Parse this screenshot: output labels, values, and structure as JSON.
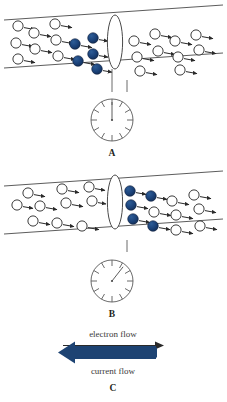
{
  "figure": {
    "background_color": "#ffffff",
    "colors": {
      "carrier_filled": "#17396b",
      "carrier_open_fill": "#ffffff",
      "outline": "#3b3b3b",
      "tube": "#4a4a4a",
      "current_arrow": "#1d4373",
      "text": "#231f20"
    }
  },
  "panels": [
    {
      "id": "A",
      "label": "A",
      "tube": {
        "name": "conductor-tube",
        "top_left_y": 14,
        "top_right_y": 6,
        "bottom_left_y": 62,
        "bottom_right_y": 54
      },
      "barrier": {
        "name": "cross-section-lens",
        "cx": 114,
        "cy": 40,
        "rx": 7.5,
        "ry": 27
      },
      "gauge": {
        "name": "ammeter-A",
        "cx": 112,
        "cy": 122,
        "r": 21,
        "needle_angle_deg": 0,
        "needle_reading": "zero",
        "tick_count": 12
      },
      "carriers_filled_count": 5,
      "carriers_open_count": 21,
      "filled_side": "left"
    },
    {
      "id": "B",
      "label": "B",
      "tube": {
        "name": "conductor-tube",
        "top_left_y": 178,
        "top_right_y": 170,
        "bottom_left_y": 226,
        "bottom_right_y": 218
      },
      "barrier": {
        "name": "cross-section-lens",
        "cx": 114,
        "cy": 200,
        "rx": 7.5,
        "ry": 27
      },
      "gauge": {
        "name": "ammeter-B",
        "cx": 112,
        "cy": 282,
        "r": 21,
        "needle_angle_deg": 38,
        "needle_reading": "deflected",
        "tick_count": 12
      },
      "carriers_filled_count": 5,
      "carriers_open_count": 21,
      "filled_side": "right"
    },
    {
      "id": "C",
      "label": "C",
      "electron_flow_label": "electron flow",
      "electron_flow_direction": "right",
      "current_flow_label": "current flow",
      "current_flow_direction": "left"
    }
  ],
  "labels": {
    "panel_a": "A",
    "panel_b": "B",
    "panel_c": "C",
    "electron_flow": "electron flow",
    "current_flow": "current flow"
  },
  "carriers_panel_a": {
    "open": [
      {
        "x": 18,
        "y": 25
      },
      {
        "x": 34,
        "y": 31
      },
      {
        "x": 52,
        "y": 23
      },
      {
        "x": 70,
        "y": 29
      },
      {
        "x": 16,
        "y": 41
      },
      {
        "x": 34,
        "y": 46
      },
      {
        "x": 52,
        "y": 39
      },
      {
        "x": 18,
        "y": 55
      },
      {
        "x": 36,
        "y": 60
      },
      {
        "x": 54,
        "y": 54
      },
      {
        "x": 132,
        "y": 30
      },
      {
        "x": 150,
        "y": 24
      },
      {
        "x": 168,
        "y": 31
      },
      {
        "x": 188,
        "y": 25
      },
      {
        "x": 206,
        "y": 31
      },
      {
        "x": 134,
        "y": 46
      },
      {
        "x": 152,
        "y": 41
      },
      {
        "x": 172,
        "y": 47
      },
      {
        "x": 190,
        "y": 41
      },
      {
        "x": 208,
        "y": 47
      },
      {
        "x": 136,
        "y": 60
      }
    ],
    "filled": [
      {
        "x": 72,
        "y": 44
      },
      {
        "x": 90,
        "y": 37
      },
      {
        "x": 92,
        "y": 52
      },
      {
        "x": 76,
        "y": 60
      },
      {
        "x": 94,
        "y": 66
      }
    ]
  },
  "carriers_panel_b": {
    "open": [
      {
        "x": 28,
        "y": 180
      },
      {
        "x": 46,
        "y": 186
      },
      {
        "x": 64,
        "y": 178
      },
      {
        "x": 84,
        "y": 184
      },
      {
        "x": 18,
        "y": 194
      },
      {
        "x": 38,
        "y": 196
      },
      {
        "x": 58,
        "y": 192
      },
      {
        "x": 78,
        "y": 198
      },
      {
        "x": 32,
        "y": 210
      },
      {
        "x": 52,
        "y": 213
      },
      {
        "x": 72,
        "y": 208
      },
      {
        "x": 88,
        "y": 216
      },
      {
        "x": 170,
        "y": 192
      },
      {
        "x": 190,
        "y": 186
      },
      {
        "x": 208,
        "y": 193
      },
      {
        "x": 152,
        "y": 204
      },
      {
        "x": 172,
        "y": 208
      },
      {
        "x": 192,
        "y": 201
      },
      {
        "x": 210,
        "y": 208
      },
      {
        "x": 174,
        "y": 221
      },
      {
        "x": 194,
        "y": 218
      }
    ],
    "filled": [
      {
        "x": 130,
        "y": 186
      },
      {
        "x": 150,
        "y": 192
      },
      {
        "x": 132,
        "y": 200
      },
      {
        "x": 134,
        "y": 214
      },
      {
        "x": 152,
        "y": 220
      }
    ]
  }
}
